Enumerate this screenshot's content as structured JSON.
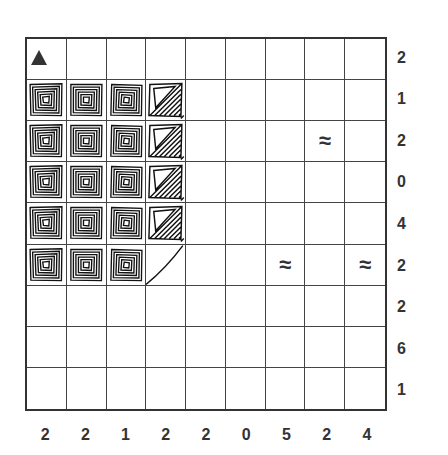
{
  "puzzle": {
    "type": "grid-puzzle",
    "rows": 9,
    "cols": 9,
    "row_clues": [
      "2",
      "1",
      "2",
      "0",
      "4",
      "2",
      "2",
      "6",
      "1"
    ],
    "col_clues": [
      "2",
      "2",
      "1",
      "2",
      "2",
      "0",
      "5",
      "2",
      "4"
    ],
    "symbols": {
      "triangle": "▲",
      "wave": "≈"
    },
    "marks": [
      {
        "row": 0,
        "col": 0,
        "kind": "triangle"
      },
      {
        "row": 2,
        "col": 7,
        "kind": "wave"
      },
      {
        "row": 5,
        "col": 6,
        "kind": "wave"
      },
      {
        "row": 5,
        "col": 8,
        "kind": "wave"
      }
    ],
    "textured_cells": [
      {
        "row": 1,
        "col": 0,
        "style": "spiral"
      },
      {
        "row": 1,
        "col": 1,
        "style": "spiral"
      },
      {
        "row": 1,
        "col": 2,
        "style": "spiral"
      },
      {
        "row": 1,
        "col": 3,
        "style": "diagonal"
      },
      {
        "row": 2,
        "col": 0,
        "style": "spiral"
      },
      {
        "row": 2,
        "col": 1,
        "style": "spiral"
      },
      {
        "row": 2,
        "col": 2,
        "style": "spiral"
      },
      {
        "row": 2,
        "col": 3,
        "style": "diagonal"
      },
      {
        "row": 3,
        "col": 0,
        "style": "spiral"
      },
      {
        "row": 3,
        "col": 1,
        "style": "spiral"
      },
      {
        "row": 3,
        "col": 2,
        "style": "spiral"
      },
      {
        "row": 3,
        "col": 3,
        "style": "diagonal"
      },
      {
        "row": 4,
        "col": 0,
        "style": "spiral"
      },
      {
        "row": 4,
        "col": 1,
        "style": "spiral"
      },
      {
        "row": 4,
        "col": 2,
        "style": "spiral"
      },
      {
        "row": 4,
        "col": 3,
        "style": "diagonal"
      },
      {
        "row": 5,
        "col": 0,
        "style": "spiral"
      },
      {
        "row": 5,
        "col": 1,
        "style": "spiral"
      },
      {
        "row": 5,
        "col": 2,
        "style": "spiral"
      },
      {
        "row": 5,
        "col": 3,
        "style": "split"
      }
    ],
    "colors": {
      "line": "#333333",
      "background": "#ffffff"
    }
  }
}
